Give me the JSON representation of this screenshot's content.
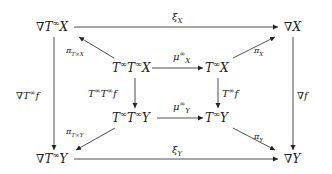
{
  "nodes": {
    "nabla_Tinf_X": {
      "nabla": "∇",
      "base": "T",
      "sup": "∞",
      "arg": "X"
    },
    "nabla_X": {
      "nabla": "∇",
      "arg": "X"
    },
    "Tinf_Tinf_X": {
      "b1": "T",
      "s1": "∞",
      "b2": "T",
      "s2": "∞",
      "arg": "X"
    },
    "Tinf_X": {
      "base": "T",
      "sup": "∞",
      "arg": "X"
    },
    "Tinf_Tinf_Y": {
      "b1": "T",
      "s1": "∞",
      "b2": "T",
      "s2": "∞",
      "arg": "Y"
    },
    "Tinf_Y": {
      "base": "T",
      "sup": "∞",
      "arg": "Y"
    },
    "nabla_Tinf_Y": {
      "nabla": "∇",
      "base": "T",
      "sup": "∞",
      "arg": "Y"
    },
    "nabla_Y": {
      "nabla": "∇",
      "arg": "Y"
    }
  },
  "arrows": {
    "xi_X": {
      "sym": "ξ",
      "sub": "X"
    },
    "xi_Y": {
      "sym": "ξ",
      "sub": "Y"
    },
    "pi_TinfX": {
      "sym": "π",
      "sub": "T∞X"
    },
    "pi_X": {
      "sym": "π",
      "sub": "X"
    },
    "pi_TinfY": {
      "sym": "π",
      "sub": "T∞Y"
    },
    "pi_Y": {
      "sym": "π",
      "sub": "Y"
    },
    "mu_X": {
      "sym": "μ",
      "sup": "∞",
      "sub": "X"
    },
    "mu_Y": {
      "sym": "μ",
      "sup": "∞",
      "sub": "Y"
    },
    "Tinf_Tinf_f": {
      "text": "T∞T∞f",
      "b1": "T",
      "s1": "∞",
      "b2": "T",
      "s2": "∞",
      "arg": "f"
    },
    "Tinf_f": {
      "b1": "T",
      "s1": "∞",
      "arg": "f"
    },
    "nabla_Tinf_f": {
      "nabla": "∇",
      "b1": "T",
      "s1": "∞",
      "arg": "f"
    },
    "nabla_f": {
      "nabla": "∇",
      "arg": "f"
    }
  },
  "colors": {
    "ink": "#222222",
    "background": "#ffffff"
  }
}
